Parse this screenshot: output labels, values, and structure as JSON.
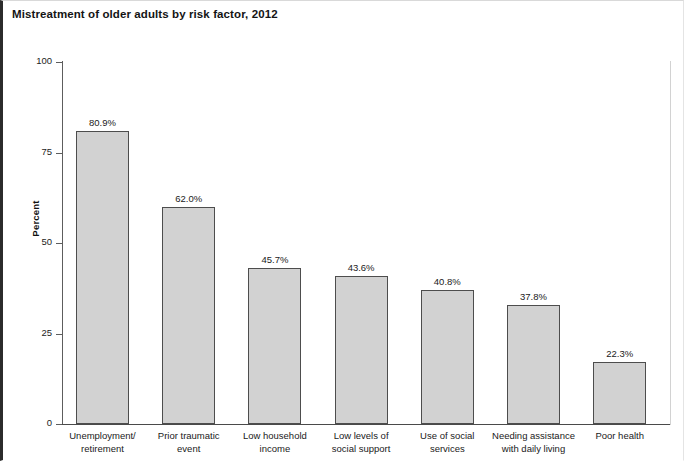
{
  "chart_data": {
    "type": "bar",
    "title": "Mistreatment of older adults by risk factor, 2012",
    "xlabel": "",
    "ylabel": "Percent",
    "ylim": [
      0,
      100
    ],
    "yticks": [
      "0",
      "25",
      "50",
      "75",
      "100"
    ],
    "grid": false,
    "legend": "none",
    "categories": [
      "Unemployment/\nretirement",
      "Prior traumatic\nevent",
      "Low household\nincome",
      "Low levels of\nsocial support",
      "Use of social\nservices",
      "Needing assistance\nwith daily living",
      "Poor health"
    ],
    "values": [
      80.9,
      62.0,
      45.7,
      43.6,
      40.8,
      37.8,
      22.3
    ],
    "data_labels": [
      "80.9%",
      "62.0%",
      "45.7%",
      "43.6%",
      "40.8%",
      "37.8%",
      "22.3%"
    ],
    "bar_pixel_tops": [
      81,
      60,
      43,
      41,
      37,
      33,
      17
    ],
    "colors": {
      "bar_fill": "#d2d2d2",
      "bar_border": "#4d4d4d",
      "axis": "#4a4a4a",
      "text": "#1a1a1a"
    }
  }
}
